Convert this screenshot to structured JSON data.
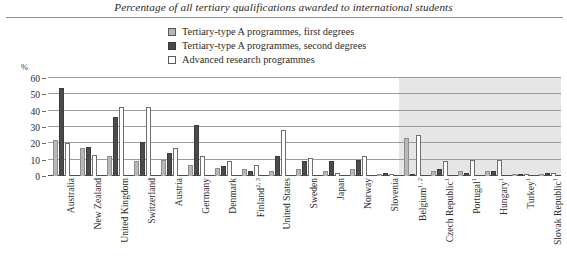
{
  "chart_data": {
    "type": "bar",
    "title": "Percentage of all tertiary qualifications awarded to international students",
    "xlabel": "",
    "ylabel": "%",
    "ylim": [
      0,
      60
    ],
    "yticks": [
      0,
      10,
      20,
      30,
      40,
      50,
      60
    ],
    "grid": true,
    "legend_position": "top-center",
    "categories": [
      "Australia",
      "New Zealand",
      "United Kingdom",
      "Switzerland",
      "Austria",
      "Germany",
      "Denmark",
      "Finland",
      "United States",
      "Sweden",
      "Japan",
      "Norway",
      "Slovenia",
      "Belgium",
      "Czech Republic",
      "Portugal",
      "Hungary",
      "Turkey",
      "Slovak Republic"
    ],
    "category_footnotes": [
      "",
      "",
      "",
      "",
      "",
      "",
      "",
      "2, 3",
      "",
      "",
      "",
      "",
      "",
      "1, 2",
      "1",
      "1",
      "1",
      "1",
      "1"
    ],
    "series": [
      {
        "name": "Tertiary-type A programmes, first degrees",
        "color": "#b8b8b8",
        "values": [
          22,
          17,
          12,
          9,
          10,
          7,
          5,
          4,
          3,
          4,
          3,
          4,
          1,
          23,
          3,
          3,
          3,
          1,
          1
        ]
      },
      {
        "name": "Tertiary-type A programmes, second degrees",
        "color": "#4b4b4b",
        "values": [
          54,
          18,
          36,
          21,
          14,
          31,
          6,
          3,
          12,
          9,
          9,
          10,
          2,
          1,
          4,
          2,
          3,
          1,
          2
        ]
      },
      {
        "name": "Advanced research programmes",
        "color": "#ffffff",
        "values": [
          20,
          13,
          42,
          42,
          17,
          12,
          9,
          7,
          28,
          11,
          2,
          12,
          1,
          25,
          9,
          10,
          10,
          1,
          2
        ]
      }
    ],
    "shaded_region": {
      "from_category": "Belgium",
      "to_category": "Slovak Republic",
      "color": "#e6e6e6"
    }
  },
  "legend": {
    "items": [
      {
        "label": "Tertiary-type A programmes, first degrees",
        "swatch": "light"
      },
      {
        "label": "Tertiary-type A programmes, second degrees",
        "swatch": "dark"
      },
      {
        "label": "Advanced research programmes",
        "swatch": "white"
      }
    ]
  },
  "axis": {
    "unit_label": "%"
  }
}
